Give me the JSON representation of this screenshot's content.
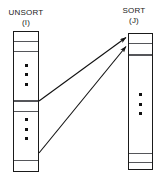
{
  "diagram": {
    "title": "",
    "type": "array-transfer-diagram",
    "colors": {
      "stroke": "#1a1a1a",
      "divider": "#55565a",
      "background": "#ffffff",
      "dot": "#111111"
    },
    "columns": [
      {
        "id": "unsort",
        "name": "UNSORT",
        "index": "(I)",
        "cells": 6,
        "ellipsis_count": 2,
        "dividers_pct": [
          6.5,
          13.5,
          49.0,
          56.5,
          92.0
        ],
        "ellipsis_top_pct": [
          23.0,
          62.0
        ]
      },
      {
        "id": "sort",
        "name": "SORT",
        "index": "(J)",
        "cells": 5,
        "ellipsis_count": 1,
        "dividers_pct": [
          6.5,
          15.0,
          88.0,
          94.5
        ],
        "ellipsis_top_pct": [
          44.0
        ]
      }
    ],
    "arrows": [
      {
        "id": "arrow-upper",
        "from_column": "unsort",
        "to_column": "sort",
        "x1": 39,
        "y1": 101,
        "x2": 128,
        "y2": 37
      },
      {
        "id": "arrow-lower",
        "from_column": "unsort",
        "to_column": "sort",
        "x1": 39,
        "y1": 153,
        "x2": 128,
        "y2": 46
      }
    ]
  }
}
